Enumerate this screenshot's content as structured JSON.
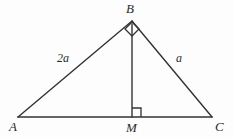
{
  "figure": {
    "type": "geometry-diagram",
    "shape": "right-triangle-with-altitude",
    "background_color": "#fdfdfd",
    "stroke_color": "#333333",
    "stroke_width": 1.4,
    "text_color": "#2b2b2b",
    "vertices": [
      {
        "name": "A",
        "label": "A",
        "x": 18,
        "y": 117
      },
      {
        "name": "B",
        "label": "B",
        "x": 132,
        "y": 21
      },
      {
        "name": "C",
        "label": "C",
        "x": 212,
        "y": 117
      },
      {
        "name": "M",
        "label": "M",
        "x": 132,
        "y": 117
      }
    ],
    "segments": [
      {
        "name": "side-AB",
        "from": "A",
        "to": "B"
      },
      {
        "name": "side-BC",
        "from": "B",
        "to": "C"
      },
      {
        "name": "base-AC",
        "from": "A",
        "to": "C"
      },
      {
        "name": "altitude-BM",
        "from": "B",
        "to": "M"
      }
    ],
    "side_labels": [
      {
        "name": "side-label-AB",
        "segment": "AB",
        "label": "2a",
        "x": 57,
        "y": 52
      },
      {
        "name": "side-label-BC",
        "segment": "BC",
        "label": "a",
        "x": 176,
        "y": 52
      }
    ],
    "right_angle_markers": [
      {
        "name": "right-angle-at-B",
        "at_vertex": "B",
        "style": "diamond",
        "size": 12
      },
      {
        "name": "right-angle-at-M",
        "at_vertex": "M",
        "style": "square",
        "size": 9
      }
    ]
  }
}
